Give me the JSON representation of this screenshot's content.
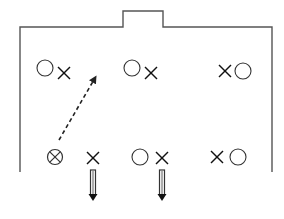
{
  "diagram": {
    "type": "play-formation",
    "colors": {
      "line": "#555555",
      "marker": "#333333",
      "background": "#ffffff"
    },
    "outline": {
      "left": 20,
      "right": 272,
      "top": 27,
      "bottom": 172,
      "notch": {
        "left": 123,
        "right": 163,
        "top": 11
      }
    },
    "markers": [
      {
        "kind": "circle",
        "x": 45,
        "y": 68,
        "label": "O"
      },
      {
        "kind": "x",
        "x": 64,
        "y": 73,
        "label": "X"
      },
      {
        "kind": "circle",
        "x": 132,
        "y": 68,
        "label": "O"
      },
      {
        "kind": "x",
        "x": 151,
        "y": 73,
        "label": "X"
      },
      {
        "kind": "x",
        "x": 225,
        "y": 71,
        "label": "X"
      },
      {
        "kind": "circle",
        "x": 243,
        "y": 71,
        "label": "O"
      },
      {
        "kind": "circle-x",
        "x": 55,
        "y": 157,
        "label": "⊗"
      },
      {
        "kind": "x",
        "x": 93,
        "y": 158,
        "label": "X"
      },
      {
        "kind": "circle",
        "x": 140,
        "y": 157,
        "label": "O"
      },
      {
        "kind": "x",
        "x": 162,
        "y": 158,
        "label": "X"
      },
      {
        "kind": "x",
        "x": 217,
        "y": 157,
        "label": "X"
      },
      {
        "kind": "circle",
        "x": 238,
        "y": 157,
        "label": "O"
      }
    ],
    "arrows": [
      {
        "style": "dashed",
        "from": [
          59,
          140
        ],
        "to": [
          95,
          78
        ]
      },
      {
        "style": "double-solid",
        "from": [
          93,
          170
        ],
        "to": [
          93,
          201
        ]
      },
      {
        "style": "double-solid",
        "from": [
          162,
          170
        ],
        "to": [
          162,
          201
        ]
      }
    ]
  }
}
